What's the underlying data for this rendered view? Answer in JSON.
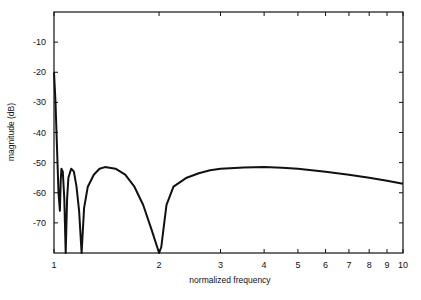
{
  "chart_data": {
    "type": "line",
    "title": "",
    "xlabel": "normalized frequency",
    "ylabel": "magnitude (dB)",
    "x_scale": "log",
    "xlim": [
      1,
      10
    ],
    "ylim": [
      -80,
      0
    ],
    "grid": false,
    "legend": null,
    "x_ticks": [
      1,
      2,
      3,
      4,
      5,
      6,
      7,
      8,
      9,
      10
    ],
    "x_tick_labels": [
      "1",
      "2",
      "3",
      "4",
      "5",
      "6",
      "7",
      "8",
      "9",
      "10"
    ],
    "y_ticks": [
      -10,
      -20,
      -30,
      -40,
      -50,
      -60,
      -70
    ],
    "y_tick_labels": [
      "-10",
      "-20",
      "-30",
      "-40",
      "-50",
      "-60",
      "-70"
    ],
    "series": [
      {
        "name": "magnitude response",
        "color": "#111111",
        "x": [
          1.0,
          1.01,
          1.02,
          1.03,
          1.04,
          1.045,
          1.05,
          1.06,
          1.07,
          1.08,
          1.09,
          1.1,
          1.12,
          1.14,
          1.16,
          1.18,
          1.2,
          1.22,
          1.25,
          1.3,
          1.35,
          1.4,
          1.5,
          1.6,
          1.7,
          1.8,
          1.9,
          2.0,
          2.03,
          2.06,
          2.1,
          2.2,
          2.4,
          2.6,
          2.8,
          3.0,
          3.5,
          4.0,
          4.5,
          5.0,
          6.0,
          7.0,
          8.0,
          9.0,
          10.0
        ],
        "y": [
          -20,
          -30,
          -45,
          -60,
          -66,
          -56,
          -52,
          -53,
          -62,
          -80,
          -62,
          -55,
          -52,
          -53,
          -58,
          -66,
          -80,
          -65,
          -58,
          -54,
          -52,
          -51.5,
          -52,
          -54,
          -58,
          -64,
          -72,
          -80,
          -78,
          -72,
          -64,
          -58,
          -55,
          -53.5,
          -52.5,
          -52,
          -51.6,
          -51.5,
          -51.7,
          -52,
          -53,
          -54,
          -55,
          -56,
          -57
        ]
      }
    ]
  }
}
